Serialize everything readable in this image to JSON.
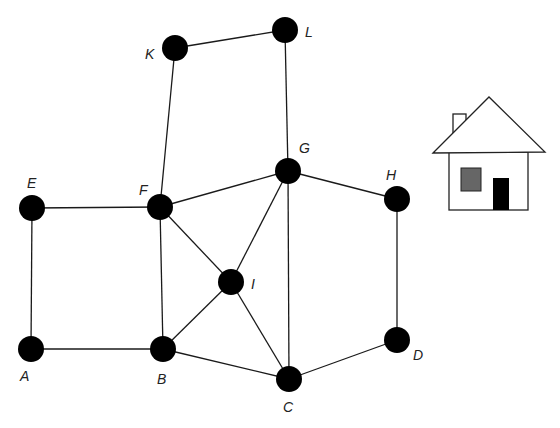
{
  "diagram": {
    "type": "graph",
    "nodes": [
      {
        "id": "A",
        "x": 31,
        "y": 349,
        "lx": 20,
        "ly": 381
      },
      {
        "id": "B",
        "x": 163,
        "y": 349,
        "lx": 157,
        "ly": 384
      },
      {
        "id": "C",
        "x": 289,
        "y": 379,
        "lx": 283,
        "ly": 412
      },
      {
        "id": "D",
        "x": 397,
        "y": 340,
        "lx": 413,
        "ly": 360
      },
      {
        "id": "E",
        "x": 32,
        "y": 208,
        "lx": 27,
        "ly": 188
      },
      {
        "id": "F",
        "x": 160,
        "y": 207,
        "lx": 139,
        "ly": 195
      },
      {
        "id": "G",
        "x": 288,
        "y": 171,
        "lx": 299,
        "ly": 153
      },
      {
        "id": "H",
        "x": 397,
        "y": 199,
        "lx": 386,
        "ly": 180
      },
      {
        "id": "I",
        "x": 231,
        "y": 282,
        "lx": 251,
        "ly": 289
      },
      {
        "id": "K",
        "x": 175,
        "y": 48,
        "lx": 145,
        "ly": 59
      },
      {
        "id": "L",
        "x": 285,
        "y": 30,
        "lx": 305,
        "ly": 37
      }
    ],
    "edges": [
      [
        "E",
        "F"
      ],
      [
        "E",
        "A"
      ],
      [
        "A",
        "B"
      ],
      [
        "B",
        "F"
      ],
      [
        "F",
        "K"
      ],
      [
        "K",
        "L"
      ],
      [
        "L",
        "G"
      ],
      [
        "F",
        "G"
      ],
      [
        "F",
        "I"
      ],
      [
        "B",
        "I"
      ],
      [
        "I",
        "G"
      ],
      [
        "I",
        "C"
      ],
      [
        "G",
        "C"
      ],
      [
        "B",
        "C"
      ],
      [
        "G",
        "H"
      ],
      [
        "H",
        "D"
      ],
      [
        "D",
        "C"
      ]
    ],
    "house": {
      "roof": "433,153 489,97 545,152",
      "chimney": {
        "x": 453,
        "y": 114,
        "w": 13,
        "h": 20
      },
      "body": {
        "x": 449,
        "y": 152,
        "w": 79,
        "h": 58
      },
      "window": {
        "x": 461,
        "y": 168,
        "w": 20,
        "h": 23,
        "color": "#666666"
      },
      "door": {
        "x": 493,
        "y": 178,
        "w": 16,
        "h": 32,
        "color": "#000000"
      }
    }
  }
}
